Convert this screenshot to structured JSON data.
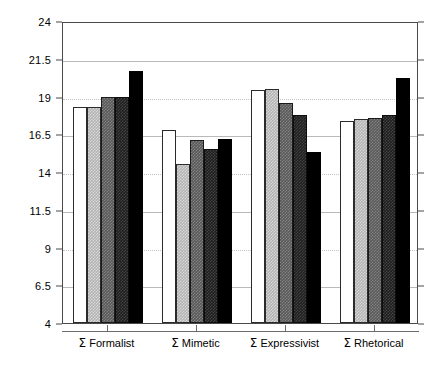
{
  "chart_data": {
    "type": "bar",
    "title": "",
    "subtitle": "",
    "xlabel": "",
    "ylabel": "",
    "ylim": [
      4,
      24
    ],
    "ytick_labels": [
      "4",
      "6.5",
      "9",
      "11.5",
      "14",
      "16.5",
      "19",
      "21.5",
      "24"
    ],
    "ytick_values": [
      4,
      6.5,
      9,
      11.5,
      14,
      16.5,
      19,
      21.5,
      24
    ],
    "grid": true,
    "grid_axis": "y",
    "legend": false,
    "legend_position": "none",
    "categories": [
      "Σ Formalist",
      "Σ Mimetic",
      "Σ Expressivist",
      "Σ Rhetorical"
    ],
    "series": [
      {
        "name": "Series 1",
        "style": "white",
        "color": "#ffffff",
        "values": [
          18.3,
          16.8,
          19.4,
          17.4
        ]
      },
      {
        "name": "Series 2",
        "style": "light-gray",
        "color": "#b3b3b3",
        "values": [
          18.3,
          14.5,
          19.5,
          17.5
        ]
      },
      {
        "name": "Series 3",
        "style": "mid-gray",
        "color": "#595959",
        "values": [
          19.0,
          16.1,
          18.6,
          17.6
        ]
      },
      {
        "name": "Series 4",
        "style": "dark-gray",
        "color": "#1f1f1f",
        "values": [
          19.0,
          15.5,
          17.8,
          17.8
        ]
      },
      {
        "name": "Series 5",
        "style": "black",
        "color": "#000000",
        "values": [
          20.7,
          16.2,
          15.3,
          20.2
        ]
      }
    ]
  }
}
